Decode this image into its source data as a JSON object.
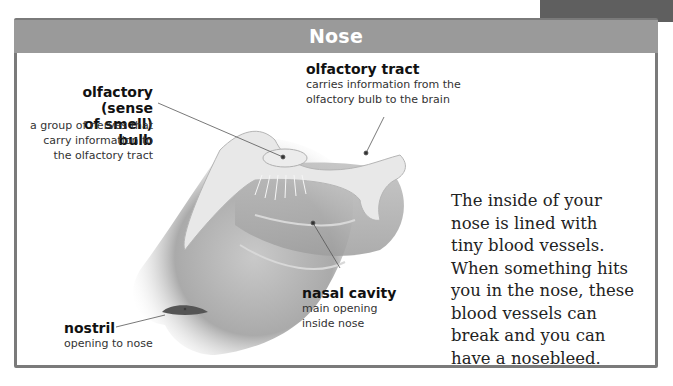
{
  "header": {
    "title": "Nose"
  },
  "colors": {
    "header_bar": "#9a9a9a",
    "frame_border": "#7a7a7a",
    "corner_tab": "#5f5f5f",
    "text": "#222222"
  },
  "labels": {
    "olfactory_bulb": {
      "title_line1": "olfactory (sense",
      "title_line2": "of smell) bulb",
      "desc_line1": "a group of nerves that",
      "desc_line2": "carry information to",
      "desc_line3": "the olfactory tract"
    },
    "olfactory_tract": {
      "title": "olfactory tract",
      "desc_line1": "carries information from the",
      "desc_line2": "olfactory bulb to the brain"
    },
    "nasal_cavity": {
      "title": "nasal cavity",
      "desc_line1": "main opening",
      "desc_line2": "inside nose"
    },
    "nostril": {
      "title": "nostril",
      "desc_line1": "opening to nose"
    }
  },
  "body_text": {
    "lines": [
      "The inside of your",
      "nose is lined with",
      "tiny blood vessels.",
      "When something hits",
      "you in the nose, these",
      "blood vessels can",
      "break and you can",
      "have a nosebleed."
    ]
  }
}
